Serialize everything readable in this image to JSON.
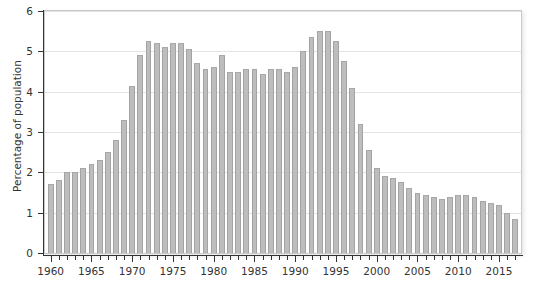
{
  "chart_data": {
    "type": "bar",
    "title": "",
    "subtitle": "",
    "xlabel": "",
    "ylabel": "Percentage of population",
    "xlim": [
      1959.3,
      2017.7
    ],
    "ylim": [
      0,
      6
    ],
    "grid": true,
    "legend": null,
    "y_ticks": [
      0,
      1,
      2,
      3,
      4,
      5,
      6
    ],
    "y_tick_labels": [
      "0",
      "1",
      "2",
      "3",
      "4",
      "5",
      "6"
    ],
    "x_major_ticks": [
      1960,
      1965,
      1970,
      1975,
      1980,
      1985,
      1990,
      1995,
      2000,
      2005,
      2010,
      2015
    ],
    "x_major_tick_labels": [
      "1960",
      "1965",
      "1970",
      "1975",
      "1980",
      "1985",
      "1990",
      "1995",
      "2000",
      "2005",
      "2010",
      "2015"
    ],
    "x_minor_tick_interval": 1,
    "bar_color": "#bdbdbd",
    "bar_edge_color": "#a3a3a3",
    "gridline_color": "#e3e3e3",
    "axis_color": "#333333",
    "categories": [
      "1960",
      "1961",
      "1962",
      "1963",
      "1964",
      "1965",
      "1966",
      "1967",
      "1968",
      "1969",
      "1970",
      "1971",
      "1972",
      "1973",
      "1974",
      "1975",
      "1976",
      "1977",
      "1978",
      "1979",
      "1980",
      "1981",
      "1982",
      "1983",
      "1984",
      "1985",
      "1986",
      "1987",
      "1988",
      "1989",
      "1990",
      "1991",
      "1992",
      "1993",
      "1994",
      "1995",
      "1996",
      "1997",
      "1998",
      "1999",
      "2000",
      "2001",
      "2002",
      "2003",
      "2004",
      "2005",
      "2006",
      "2007",
      "2008",
      "2009",
      "2010",
      "2011",
      "2012",
      "2013",
      "2014",
      "2015",
      "2016",
      "2017"
    ],
    "values": [
      1.7,
      1.8,
      2.0,
      2.0,
      2.1,
      2.2,
      2.3,
      2.5,
      2.8,
      3.3,
      4.15,
      4.9,
      5.25,
      5.2,
      5.1,
      5.2,
      5.2,
      5.05,
      4.7,
      4.55,
      4.6,
      4.9,
      4.5,
      4.5,
      4.55,
      4.55,
      4.45,
      4.55,
      4.55,
      4.5,
      4.6,
      5.0,
      5.35,
      5.5,
      5.5,
      5.25,
      4.75,
      4.1,
      3.2,
      2.55,
      2.1,
      1.9,
      1.85,
      1.75,
      1.6,
      1.5,
      1.45,
      1.4,
      1.35,
      1.4,
      1.45,
      1.45,
      1.4,
      1.3,
      1.25,
      1.2,
      1.0,
      0.85
    ]
  }
}
